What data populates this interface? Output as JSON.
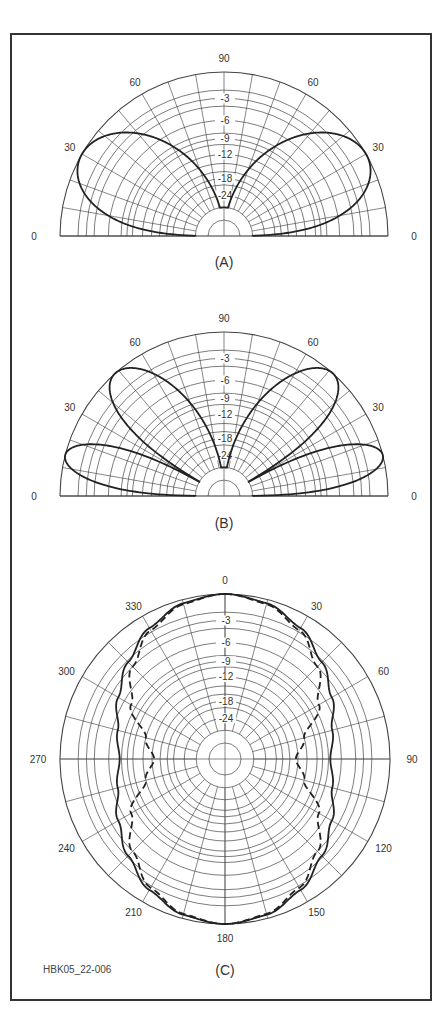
{
  "figure_id": "HBK05_22-006",
  "scale": {
    "ring_labels": [
      "-3",
      "-6",
      "-9",
      "-12",
      "-18",
      "-24"
    ],
    "ring_db": [
      0,
      -2,
      -3,
      -4,
      -6,
      -8,
      -9,
      -10,
      -12,
      -14,
      -16,
      -18,
      -20,
      -24,
      -30,
      -40
    ],
    "note": "ARRL log-periodic scale, radius factor 0.89 per 2 dB"
  },
  "chart_data": [
    {
      "type": "polar",
      "panel": "A",
      "caption": "(A)",
      "half_plane": true,
      "angle_labels": [
        {
          "text": "90",
          "angle": 90
        },
        {
          "text": "60",
          "angle": 120
        },
        {
          "text": "60",
          "angle": 60
        },
        {
          "text": "30",
          "angle": 150
        },
        {
          "text": "30",
          "angle": 30
        },
        {
          "text": "0",
          "angle": 180
        },
        {
          "text": "0",
          "angle": 0
        }
      ],
      "spoke_step_deg": 10,
      "series": [
        {
          "name": "elevation pattern",
          "style": "solid",
          "model": "abs(sin(pi*sin(theta)))",
          "peak_elevation_deg": [
            30,
            150
          ],
          "peak_db": 0,
          "null_elevation_deg": [
            0,
            90,
            180
          ]
        }
      ]
    },
    {
      "type": "polar",
      "panel": "B",
      "caption": "(B)",
      "half_plane": true,
      "angle_labels": [
        {
          "text": "90",
          "angle": 90
        },
        {
          "text": "60",
          "angle": 120
        },
        {
          "text": "60",
          "angle": 60
        },
        {
          "text": "30",
          "angle": 150
        },
        {
          "text": "30",
          "angle": 30
        },
        {
          "text": "0",
          "angle": 180
        },
        {
          "text": "0",
          "angle": 0
        }
      ],
      "spoke_step_deg": 10,
      "series": [
        {
          "name": "elevation pattern",
          "style": "solid",
          "model": "abs(sin(2*pi*sin(theta)))",
          "peak_elevation_deg": [
            14.5,
            48.6,
            131.4,
            165.5
          ],
          "peak_db": 0,
          "null_elevation_deg": [
            0,
            30,
            90,
            150,
            180
          ]
        }
      ]
    },
    {
      "type": "polar",
      "panel": "C",
      "caption": "(C)",
      "half_plane": false,
      "angle_labels": [
        {
          "text": "0",
          "angle": 0
        },
        {
          "text": "30",
          "angle": 30
        },
        {
          "text": "60",
          "angle": 60
        },
        {
          "text": "90",
          "angle": 90
        },
        {
          "text": "120",
          "angle": 120
        },
        {
          "text": "150",
          "angle": 150
        },
        {
          "text": "180",
          "angle": 180
        },
        {
          "text": "210",
          "angle": 210
        },
        {
          "text": "240",
          "angle": 240
        },
        {
          "text": "270",
          "angle": 270
        },
        {
          "text": "300",
          "angle": 300
        },
        {
          "text": "330",
          "angle": 330
        }
      ],
      "spoke_step_deg": 15,
      "series": [
        {
          "name": "solid",
          "style": "solid",
          "azimuth_deg": [
            0,
            15,
            30,
            45,
            60,
            75,
            90
          ],
          "db": [
            0,
            -0.4,
            -1.5,
            -3.2,
            -5.0,
            -6.8,
            -7.7
          ]
        },
        {
          "name": "dashed",
          "style": "dashed",
          "azimuth_deg": [
            0,
            15,
            30,
            45,
            60,
            75,
            90
          ],
          "db": [
            0,
            -0.5,
            -1.8,
            -4.0,
            -7.2,
            -12.0,
            -14.5
          ]
        }
      ]
    }
  ]
}
